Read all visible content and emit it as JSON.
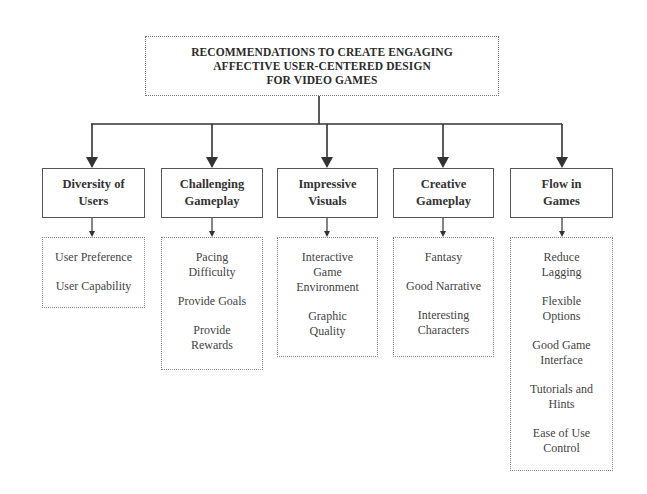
{
  "title": {
    "lines": [
      "RECOMMENDATIONS TO CREATE ENGAGING",
      "AFFECTIVE USER-CENTERED DESIGN",
      "FOR VIDEO GAMES"
    ]
  },
  "categories": [
    {
      "lines": [
        "Diversity of",
        "Users"
      ],
      "items": [
        [
          "User Preference"
        ],
        [
          "User Capability"
        ]
      ]
    },
    {
      "lines": [
        "Challenging",
        "Gameplay"
      ],
      "items": [
        [
          "Pacing",
          "Difficulty"
        ],
        [
          "Provide Goals"
        ],
        [
          "Provide",
          "Rewards"
        ]
      ]
    },
    {
      "lines": [
        "Impressive",
        "Visuals"
      ],
      "items": [
        [
          "Interactive",
          "Game",
          "Environment"
        ],
        [
          "Graphic",
          "Quality"
        ]
      ]
    },
    {
      "lines": [
        "Creative",
        "Gameplay"
      ],
      "items": [
        [
          "Fantasy"
        ],
        [
          "Good Narrative"
        ],
        [
          "Interesting",
          "Characters"
        ]
      ]
    },
    {
      "lines": [
        "Flow in",
        "Games"
      ],
      "items": [
        [
          "Reduce",
          "Lagging"
        ],
        [
          "Flexible",
          "Options"
        ],
        [
          "Good Game",
          "Interface"
        ],
        [
          "Tutorials and",
          "Hints"
        ],
        [
          "Ease of Use",
          "Control"
        ]
      ]
    }
  ],
  "colors": {
    "line": "#333333",
    "box_border": "#555555",
    "dotted_border": "#888888",
    "text": "#2a2a2a"
  }
}
